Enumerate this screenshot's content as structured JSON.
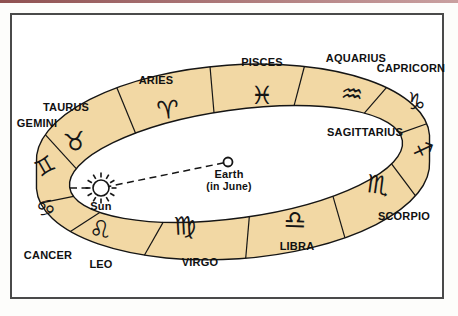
{
  "frame": {
    "top_rule_color_left": "#8f5151",
    "top_rule_color_right": "#c9a0a0",
    "border_color": "#4a4a4a",
    "background": "#ffffff"
  },
  "diagram": {
    "band_color": "#f2d8a4",
    "outline_color": "#151515",
    "interior_color": "#ffffff",
    "label_color": "#111111",
    "segments": [
      {
        "id": "gemini",
        "label": "GEMINI",
        "symbol": "♊"
      },
      {
        "id": "taurus",
        "label": "TAURUS",
        "symbol": "♉"
      },
      {
        "id": "aries",
        "label": "ARIES",
        "symbol": "♈"
      },
      {
        "id": "pisces",
        "label": "PISCES",
        "symbol": "♓"
      },
      {
        "id": "aquarius",
        "label": "AQUARIUS",
        "symbol": "♒"
      },
      {
        "id": "capricorn",
        "label": "CAPRICORN",
        "symbol": "♑"
      },
      {
        "id": "sagittarius",
        "label": "SAGITTARIUS",
        "symbol": "♐"
      },
      {
        "id": "scorpio",
        "label": "SCORPIO",
        "symbol": "♏"
      },
      {
        "id": "libra",
        "label": "LIBRA",
        "symbol": "♎"
      },
      {
        "id": "virgo",
        "label": "VIRGO",
        "symbol": "♍"
      },
      {
        "id": "leo",
        "label": "LEO",
        "symbol": "♌"
      },
      {
        "id": "cancer",
        "label": "CANCER",
        "symbol": "♋"
      }
    ],
    "sun": {
      "label": "Sun"
    },
    "earth": {
      "label": "Earth",
      "sublabel": "(in June)"
    }
  }
}
